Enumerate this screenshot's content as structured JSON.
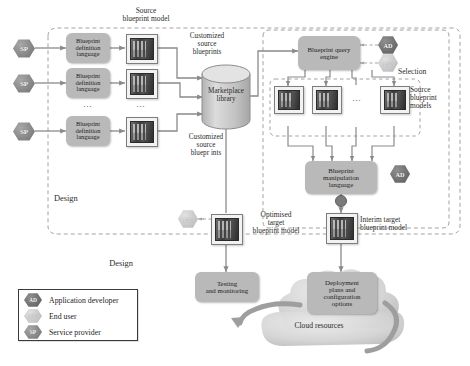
{
  "actors": {
    "ad": {
      "abbr": "AD",
      "label": "Application developer",
      "color": "#5e5e5e"
    },
    "eu": {
      "abbr": "EU",
      "label": "End user",
      "color": "#cfcfcf"
    },
    "sp": {
      "abbr": "SP",
      "label": "Service provider",
      "color": "#858585"
    }
  },
  "legend": {
    "name": "legend",
    "rows": [
      {
        "abbr": "AD",
        "label": "Application developer",
        "kind": "ad"
      },
      {
        "abbr": "EU",
        "label": "End user",
        "kind": "eu"
      },
      {
        "abbr": "SP",
        "label": "Service provider",
        "kind": "sp"
      }
    ]
  },
  "zones": {
    "design_inner": "Design",
    "design_outer": "Design",
    "selection": "Selection"
  },
  "design_lane": {
    "providers": [
      {
        "abbr": "SP"
      },
      {
        "abbr": "SP"
      },
      {
        "abbr": "SP"
      }
    ],
    "bdl_boxes": [
      {
        "label": "Blueprint\ndefinition\nlanguage"
      },
      {
        "label": "Blueprint\ndefinition\nlanguage"
      },
      {
        "label": "Blueprint\ndefinition\nlanguage"
      }
    ],
    "ellipsis_bdl": "...",
    "ellipsis_models": "...",
    "source_model_label": "Source\nblueprint model",
    "customized_top": "Customized\nsource\nblueprints",
    "customized_bottom": "Customized\nsource\nbluepr ints"
  },
  "marketplace": {
    "label": "Marketplace\nlibrary"
  },
  "selection_lane": {
    "query_engine": "Blueprint query\nengine",
    "source_models_label": "Source\nblueprint\nmodels",
    "model_ellipsis": "...",
    "manipulation_language": "Blueprint\nmanipulation\nlanguage",
    "interim_label": "Interim target\nblueprint model"
  },
  "outputs": {
    "optimised_label": "Optimised\ntarget\nblueprint model",
    "deployment_label": "Deployment\nplans and\nconfiguration\noptions",
    "testing_label": "Testing\nand monitoring",
    "cloud_label": "Cloud resources"
  },
  "colors": {
    "box_fill": "#b9b9b9",
    "cloud_fill": "#d8d8d8",
    "cylinder_fill": "#c6c6c6",
    "line": "#8a8a8a",
    "dash": "#9a9a9a",
    "text": "#1e1e1e"
  }
}
